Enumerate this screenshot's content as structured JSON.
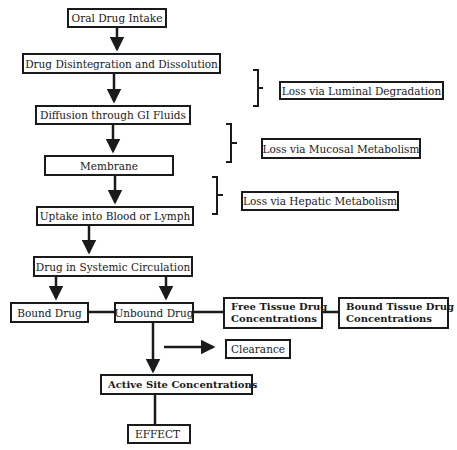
{
  "diagram": {
    "main_flow": [
      {
        "id": "oral",
        "label": "Oral Drug Intake"
      },
      {
        "id": "disint",
        "label": "Drug Disintegration and Dissolution"
      },
      {
        "id": "diffusion",
        "label": "Diffusion through GI Fluids"
      },
      {
        "id": "membrane",
        "label": "Membrane"
      },
      {
        "id": "uptake",
        "label": "Uptake into Blood or Lymph"
      },
      {
        "id": "systemic",
        "label": "Drug in Systemic Circulation"
      }
    ],
    "losses": [
      {
        "id": "luminal",
        "label": "Loss via Luminal Degradation"
      },
      {
        "id": "mucosal",
        "label": "Loss via Mucosal Metabolism"
      },
      {
        "id": "hepatic",
        "label": "Loss via Hepatic Metabolism"
      }
    ],
    "distribution": {
      "bound_drug": "Bound Drug",
      "unbound_drug": "Unbound Drug",
      "free_tissue_line1": "Free Tissue Drug",
      "free_tissue_line2": "Concentrations",
      "bound_tissue_line1": "Bound Tissue Drug",
      "bound_tissue_line2": "Concentrations",
      "clearance": "Clearance",
      "active_site": "Active Site Concentrations",
      "effect": "EFFECT"
    },
    "colors": {
      "stroke": "#1a1a1a",
      "background": "#ffffff"
    }
  }
}
